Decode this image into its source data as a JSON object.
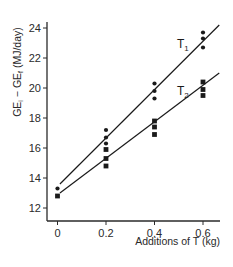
{
  "chart_data": {
    "type": "scatter",
    "title": "",
    "xlabel": "Additions of T (kg)",
    "ylabel": "GE_i − GE_f (MJ/day)",
    "ylabel_parts": {
      "main1": "GE",
      "sub1": "i",
      "mid": " − GE",
      "sub2": "f",
      "tail": " (MJ/day)"
    },
    "xlim": [
      0,
      0.667
    ],
    "ylim": [
      11.3,
      24.8
    ],
    "x_ticks": [
      0,
      0.2,
      0.4,
      0.6
    ],
    "x_tick_labels": [
      "0",
      "0.2",
      "0.4",
      "0.6"
    ],
    "y_ticks": [
      12,
      14,
      16,
      18,
      20,
      22,
      24
    ],
    "y_tick_labels": [
      "12",
      "14",
      "16",
      "18",
      "20",
      "22",
      "24"
    ],
    "grid": false,
    "legend": "inline labels",
    "series": [
      {
        "name": "T1",
        "label_main": "T",
        "label_sub": "1",
        "marker": "circle",
        "points": [
          {
            "x": 0.0,
            "y": 13.3
          },
          {
            "x": 0.2,
            "y": 17.2
          },
          {
            "x": 0.2,
            "y": 16.7
          },
          {
            "x": 0.2,
            "y": 16.3
          },
          {
            "x": 0.4,
            "y": 20.3
          },
          {
            "x": 0.4,
            "y": 19.8
          },
          {
            "x": 0.4,
            "y": 19.3
          },
          {
            "x": 0.6,
            "y": 23.7
          },
          {
            "x": 0.6,
            "y": 23.3
          },
          {
            "x": 0.6,
            "y": 22.7
          }
        ],
        "fit_line": {
          "x0": 0.01,
          "y0": 13.6,
          "x1": 0.667,
          "y1": 24.2
        }
      },
      {
        "name": "T2",
        "label_main": "T",
        "label_sub": "2",
        "marker": "square",
        "points": [
          {
            "x": 0.0,
            "y": 12.8
          },
          {
            "x": 0.2,
            "y": 15.9
          },
          {
            "x": 0.2,
            "y": 15.3
          },
          {
            "x": 0.2,
            "y": 14.8
          },
          {
            "x": 0.4,
            "y": 17.8
          },
          {
            "x": 0.4,
            "y": 17.4
          },
          {
            "x": 0.4,
            "y": 16.9
          },
          {
            "x": 0.6,
            "y": 20.4
          },
          {
            "x": 0.6,
            "y": 19.9
          },
          {
            "x": 0.6,
            "y": 19.5
          }
        ],
        "fit_line": {
          "x0": 0.01,
          "y0": 13.0,
          "x1": 0.667,
          "y1": 21.0
        }
      }
    ],
    "colors": {
      "ink": "#1a1a1a",
      "axis": "#2a2a2a",
      "background": "#ffffff"
    }
  }
}
